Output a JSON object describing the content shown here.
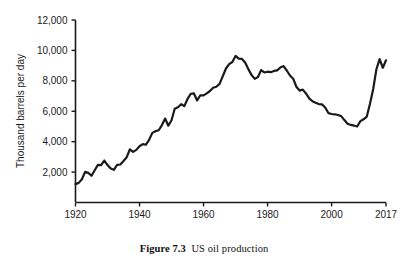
{
  "caption": {
    "label": "Figure 7.3",
    "text": "US oil production"
  },
  "chart_data": {
    "type": "line",
    "title": "",
    "subtitle": "",
    "xlabel": "",
    "ylabel": "Thousand barrels per day",
    "xlim": [
      1920,
      2017
    ],
    "ylim": [
      0,
      12000
    ],
    "grid": false,
    "legend": null,
    "legend_position": "none",
    "line_color": "#1a1a1a",
    "line_width": 2.2,
    "xticks": [
      1920,
      1940,
      1960,
      1980,
      2000,
      2017
    ],
    "xtick_labels": [
      "1920",
      "1940",
      "1960",
      "1980",
      "2000",
      "2017"
    ],
    "yticks": [
      2000,
      4000,
      6000,
      8000,
      10000,
      12000
    ],
    "ytick_labels": [
      "2,000",
      "4,000",
      "6,000",
      "8,000",
      "10,000",
      "12,000"
    ],
    "series": [
      {
        "name": "US oil production",
        "x": [
          1920,
          1921,
          1922,
          1923,
          1924,
          1925,
          1926,
          1927,
          1928,
          1929,
          1930,
          1931,
          1932,
          1933,
          1934,
          1935,
          1936,
          1937,
          1938,
          1939,
          1940,
          1941,
          1942,
          1943,
          1944,
          1945,
          1946,
          1947,
          1948,
          1949,
          1950,
          1951,
          1952,
          1953,
          1954,
          1955,
          1956,
          1957,
          1958,
          1959,
          1960,
          1961,
          1962,
          1963,
          1964,
          1965,
          1966,
          1967,
          1968,
          1969,
          1970,
          1971,
          1972,
          1973,
          1974,
          1975,
          1976,
          1977,
          1978,
          1979,
          1980,
          1981,
          1982,
          1983,
          1984,
          1985,
          1986,
          1987,
          1988,
          1989,
          1990,
          1991,
          1992,
          1993,
          1994,
          1995,
          1996,
          1997,
          1998,
          1999,
          2000,
          2001,
          2002,
          2003,
          2004,
          2005,
          2006,
          2007,
          2008,
          2009,
          2010,
          2011,
          2012,
          2013,
          2014,
          2015,
          2016,
          2017
        ],
        "values": [
          1210,
          1290,
          1530,
          2010,
          1950,
          1760,
          2120,
          2470,
          2460,
          2760,
          2460,
          2230,
          2150,
          2480,
          2500,
          2730,
          2980,
          3500,
          3330,
          3460,
          3700,
          3840,
          3800,
          4120,
          4580,
          4690,
          4750,
          5090,
          5520,
          5050,
          5410,
          6160,
          6260,
          6460,
          6340,
          6810,
          7150,
          7170,
          6710,
          7050,
          7040,
          7180,
          7330,
          7540,
          7610,
          7800,
          8300,
          8810,
          9100,
          9240,
          9640,
          9460,
          9440,
          9210,
          8770,
          8380,
          8130,
          8250,
          8710,
          8550,
          8600,
          8570,
          8650,
          8690,
          8880,
          8970,
          8680,
          8350,
          8140,
          7610,
          7360,
          7420,
          7170,
          6850,
          6660,
          6560,
          6470,
          6450,
          6250,
          5880,
          5820,
          5800,
          5750,
          5680,
          5420,
          5180,
          5100,
          5060,
          5000,
          5350,
          5470,
          5650,
          6490,
          7460,
          8760,
          9430,
          8860,
          9350
        ]
      }
    ],
    "annotations": [
      {
        "label": "peak",
        "x": 1970,
        "y": 9640
      },
      {
        "label": "trough",
        "x": 2008,
        "y": 5000
      },
      {
        "label": "shale-peak",
        "x": 2015,
        "y": 9430
      }
    ]
  },
  "axes": {
    "y_axis_name": "y-axis",
    "x_axis_name": "x-axis"
  }
}
